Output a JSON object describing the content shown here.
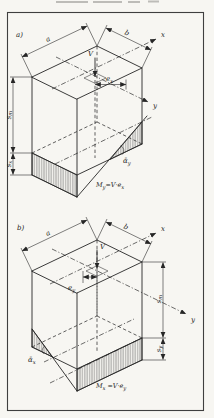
{
  "figure": {
    "diagram_a": {
      "panel_label": "a)",
      "dim_width": "a",
      "dim_depth": "b",
      "axis_x": "x",
      "axis_y": "y",
      "load": "V",
      "eccentricity": {
        "base": "e",
        "sub": "x"
      },
      "mean_settlement": {
        "base": "s",
        "sub": "m"
      },
      "edge_settlement": {
        "base": "s",
        "sub": "x"
      },
      "tilt_angle": {
        "base": "ᾱ",
        "sub": "y"
      },
      "moment": {
        "base": "M",
        "sub": "y",
        "rhs": "=V·e",
        "rhs_sub": "x"
      }
    },
    "diagram_b": {
      "panel_label": "b)",
      "dim_width": "a",
      "dim_depth": "b",
      "axis_x": "x",
      "axis_y": "y",
      "load": "V",
      "eccentricity": {
        "base": "e",
        "sub": "y"
      },
      "mean_settlement": {
        "base": "s",
        "sub": "m"
      },
      "edge_settlement": {
        "base": "s",
        "sub": "y"
      },
      "tilt_angle": {
        "base": "ᾱ",
        "sub": "x"
      },
      "moment": {
        "base": "M",
        "sub": "x",
        "rhs": " =V·e",
        "rhs_sub": "y"
      }
    }
  }
}
